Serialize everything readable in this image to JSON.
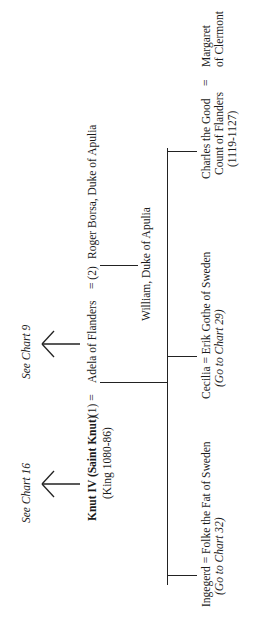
{
  "chart": {
    "orientation": "rotated-90-ccw",
    "references": {
      "see_chart_16": "See Chart 16",
      "see_chart_9": "See Chart 9"
    },
    "root": {
      "name": "Knut IV (Saint Knut)",
      "reign": "(King 1080-86)",
      "marriage_marker": "(1)  ="
    },
    "spouse": {
      "name": "Adela of Flanders",
      "second_marriage_marker": "= (2)",
      "second_spouse": "Roger Borsa, Duke of  Apulia",
      "child_of_second_marriage": "William, Duke of Apulia"
    },
    "children": [
      {
        "label": "Ingegerd = Folke the Fat of Sweden",
        "ref": "(Go to Chart 32)"
      },
      {
        "label": "Cecilia = Erik Gothe of Sweden",
        "ref": "(Go to Chart 29)"
      },
      {
        "label_line1": "Charles the Good",
        "label_line2": "Count of Flanders",
        "label_line3": "(1119-1127)",
        "marriage": "=",
        "spouse_line1": "Margaret",
        "spouse_line2": "of Clermont"
      }
    ]
  }
}
